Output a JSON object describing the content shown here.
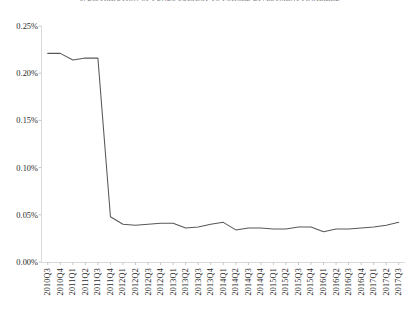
{
  "chart_data": {
    "type": "line",
    "title": "5. DISTRIBUTION OF FUNDS SUBJECT TO FORCED DIVESTMENT FINALIZED",
    "xlabel": "",
    "ylabel": "",
    "ylim": [
      0.0,
      0.25
    ],
    "ytick_labels": [
      "0.25%",
      "0.20%",
      "0.15%",
      "0.10%",
      "0.05%",
      "0.00%"
    ],
    "ytick_values": [
      0.25,
      0.2,
      0.15,
      0.1,
      0.05,
      0.0
    ],
    "grid": false,
    "legend": "none",
    "categories": [
      "2010Q3",
      "2010Q4",
      "2011Q1",
      "2011Q2",
      "2011Q3",
      "2011Q4",
      "2012Q1",
      "2012Q2",
      "2012Q3",
      "2012Q4",
      "2013Q1",
      "2013Q2",
      "2013Q3",
      "2013Q4",
      "2014Q1",
      "2014Q2",
      "2014Q3",
      "2014Q4",
      "2015Q1",
      "2015Q2",
      "2015Q3",
      "2015Q4",
      "2016Q1",
      "2016Q2",
      "2016Q3",
      "2016Q4",
      "2017Q1",
      "2017Q2",
      "2017Q3"
    ],
    "values": [
      0.221,
      0.221,
      0.214,
      0.216,
      0.216,
      0.048,
      0.04,
      0.039,
      0.04,
      0.041,
      0.041,
      0.036,
      0.037,
      0.04,
      0.042,
      0.034,
      0.036,
      0.036,
      0.035,
      0.035,
      0.037,
      0.037,
      0.032,
      0.035,
      0.035,
      0.036,
      0.037,
      0.039,
      0.042
    ],
    "series_color": "#58585a"
  }
}
